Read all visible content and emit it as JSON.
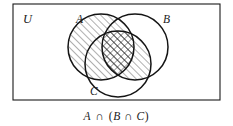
{
  "figure": {
    "type": "venn-diagram",
    "set_count": 3,
    "universe_label": "U",
    "background_color": "#ffffff",
    "stroke_color": "#1a1a1a",
    "hatch_color": "#3a3a3a"
  },
  "universe": {
    "name": "universe-rectangle",
    "label": "U",
    "x": 13,
    "y": 4,
    "width": 207,
    "height": 96
  },
  "circles": [
    {
      "id": "A",
      "label": "A",
      "cx": 101,
      "cy": 47,
      "r": 33,
      "label_x": 76,
      "label_y": 20,
      "shading": "diagonal-hatch"
    },
    {
      "id": "B",
      "label": "B",
      "cx": 135,
      "cy": 47,
      "r": 33,
      "label_x": 163,
      "label_y": 20,
      "shading": "none"
    },
    {
      "id": "C",
      "label": "C",
      "cx": 118,
      "cy": 64,
      "r": 33,
      "label_x": 90,
      "label_y": 92,
      "shading": "none"
    }
  ],
  "shaded_regions": [
    {
      "name": "circle-A-region",
      "sets": [
        "A"
      ],
      "pattern": "diagonal-hatch"
    },
    {
      "name": "B-intersect-C-region",
      "sets": [
        "B",
        "C"
      ],
      "pattern": "diagonal-hatch"
    },
    {
      "name": "A-intersect-B-intersect-C-region",
      "sets": [
        "A",
        "B",
        "C"
      ],
      "pattern": "cross-hatch"
    }
  ],
  "caption": {
    "name": "expression-caption",
    "full_text": "A ∩ (B ∩ C)",
    "tokens": [
      {
        "text": "A",
        "style": "italic"
      },
      {
        "text": "∩",
        "style": "roman"
      },
      {
        "text": "(",
        "style": "roman"
      },
      {
        "text": "B",
        "style": "italic"
      },
      {
        "text": "∩",
        "style": "roman"
      },
      {
        "text": "C",
        "style": "italic"
      },
      {
        "text": ")",
        "style": "roman"
      }
    ],
    "x": 116,
    "y": 117
  }
}
